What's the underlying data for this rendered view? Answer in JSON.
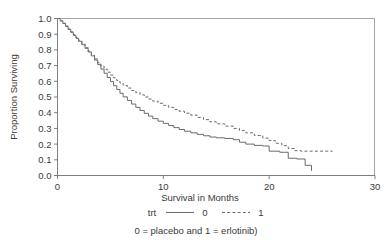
{
  "chart_data": {
    "type": "line",
    "title": "",
    "subtitle": "",
    "xlabel": "Survival in Months",
    "ylabel": "Proportion Surviving",
    "xlim": [
      0,
      30
    ],
    "ylim": [
      0.0,
      1.0
    ],
    "xticks": [
      "0",
      "10",
      "20",
      "30"
    ],
    "xtick_values": [
      0,
      10,
      20,
      30
    ],
    "yticks": [
      "0.0",
      "0.1",
      "0.2",
      "0.3",
      "0.4",
      "0.5",
      "0.6",
      "0.7",
      "0.8",
      "0.9",
      "1.0"
    ],
    "ytick_values": [
      0.0,
      0.1,
      0.2,
      0.3,
      0.4,
      0.5,
      0.6,
      0.7,
      0.8,
      0.9,
      1.0
    ],
    "grid": false,
    "legend_position": "below-axis",
    "legend_title": "trt",
    "annotation": "0 = placebo and 1 = erlotinib)",
    "line_color": "#6b6b6b",
    "axis_color": "#6f6f6f",
    "background_color": "#ffffff",
    "series": [
      {
        "name": "0",
        "label": "0",
        "description": "placebo",
        "style": "solid",
        "step": "post",
        "points": [
          [
            0.0,
            1.0
          ],
          [
            0.25,
            0.985
          ],
          [
            0.5,
            0.968
          ],
          [
            0.75,
            0.95
          ],
          [
            1.0,
            0.93
          ],
          [
            1.25,
            0.912
          ],
          [
            1.5,
            0.893
          ],
          [
            1.75,
            0.874
          ],
          [
            2.0,
            0.855
          ],
          [
            2.3,
            0.833
          ],
          [
            2.6,
            0.81
          ],
          [
            2.9,
            0.787
          ],
          [
            3.2,
            0.762
          ],
          [
            3.5,
            0.735
          ],
          [
            3.8,
            0.706
          ],
          [
            4.1,
            0.678
          ],
          [
            4.4,
            0.651
          ],
          [
            4.7,
            0.624
          ],
          [
            5.0,
            0.598
          ],
          [
            5.3,
            0.572
          ],
          [
            5.6,
            0.548
          ],
          [
            5.9,
            0.524
          ],
          [
            6.2,
            0.501
          ],
          [
            6.6,
            0.478
          ],
          [
            7.0,
            0.455
          ],
          [
            7.4,
            0.434
          ],
          [
            7.8,
            0.414
          ],
          [
            8.2,
            0.396
          ],
          [
            8.6,
            0.378
          ],
          [
            9.0,
            0.362
          ],
          [
            9.5,
            0.346
          ],
          [
            10.0,
            0.332
          ],
          [
            10.5,
            0.318
          ],
          [
            11.0,
            0.305
          ],
          [
            11.5,
            0.293
          ],
          [
            12.0,
            0.282
          ],
          [
            12.6,
            0.272
          ],
          [
            13.2,
            0.262
          ],
          [
            13.8,
            0.253
          ],
          [
            14.4,
            0.245
          ],
          [
            15.0,
            0.24
          ],
          [
            15.8,
            0.236
          ],
          [
            16.6,
            0.228
          ],
          [
            17.2,
            0.212
          ],
          [
            17.8,
            0.2
          ],
          [
            18.6,
            0.192
          ],
          [
            19.4,
            0.188
          ],
          [
            20.0,
            0.155
          ],
          [
            21.0,
            0.148
          ],
          [
            21.8,
            0.11
          ],
          [
            22.6,
            0.105
          ],
          [
            23.4,
            0.065
          ],
          [
            24.0,
            0.03
          ]
        ],
        "final_value": 0.03,
        "max_followup_months": 24.0
      },
      {
        "name": "1",
        "label": "1",
        "description": "erlotinib",
        "style": "dashed",
        "step": "post",
        "points": [
          [
            0.0,
            1.0
          ],
          [
            0.25,
            0.986
          ],
          [
            0.5,
            0.97
          ],
          [
            0.75,
            0.952
          ],
          [
            1.0,
            0.933
          ],
          [
            1.25,
            0.915
          ],
          [
            1.5,
            0.896
          ],
          [
            1.75,
            0.877
          ],
          [
            2.0,
            0.858
          ],
          [
            2.3,
            0.836
          ],
          [
            2.6,
            0.814
          ],
          [
            2.9,
            0.791
          ],
          [
            3.2,
            0.766
          ],
          [
            3.5,
            0.742
          ],
          [
            3.8,
            0.718
          ],
          [
            4.1,
            0.697
          ],
          [
            4.4,
            0.677
          ],
          [
            4.7,
            0.658
          ],
          [
            5.0,
            0.64
          ],
          [
            5.3,
            0.622
          ],
          [
            5.6,
            0.605
          ],
          [
            5.9,
            0.589
          ],
          [
            6.2,
            0.573
          ],
          [
            6.6,
            0.557
          ],
          [
            7.0,
            0.542
          ],
          [
            7.4,
            0.528
          ],
          [
            7.8,
            0.514
          ],
          [
            8.2,
            0.5
          ],
          [
            8.6,
            0.487
          ],
          [
            9.0,
            0.474
          ],
          [
            9.5,
            0.46
          ],
          [
            10.0,
            0.447
          ],
          [
            10.5,
            0.434
          ],
          [
            11.0,
            0.421
          ],
          [
            11.5,
            0.409
          ],
          [
            12.0,
            0.397
          ],
          [
            12.6,
            0.384
          ],
          [
            13.2,
            0.37
          ],
          [
            13.8,
            0.356
          ],
          [
            14.4,
            0.342
          ],
          [
            15.0,
            0.329
          ],
          [
            15.8,
            0.315
          ],
          [
            16.6,
            0.3
          ],
          [
            17.2,
            0.286
          ],
          [
            17.8,
            0.272
          ],
          [
            18.6,
            0.255
          ],
          [
            19.4,
            0.238
          ],
          [
            20.0,
            0.222
          ],
          [
            20.6,
            0.205
          ],
          [
            21.2,
            0.19
          ],
          [
            21.8,
            0.172
          ],
          [
            22.4,
            0.158
          ],
          [
            23.0,
            0.155
          ],
          [
            26.0,
            0.155
          ]
        ],
        "final_value": 0.155,
        "max_followup_months": 26.0
      }
    ]
  },
  "legend": {
    "title": "trt",
    "entries": [
      {
        "label": "0",
        "style": "solid"
      },
      {
        "label": "1",
        "style": "dashed"
      }
    ]
  },
  "caption": {
    "text": "0 = placebo and 1 = erlotinib)"
  },
  "axes": {
    "x_title": "Survival in Months",
    "y_title": "Proportion Surviving"
  }
}
